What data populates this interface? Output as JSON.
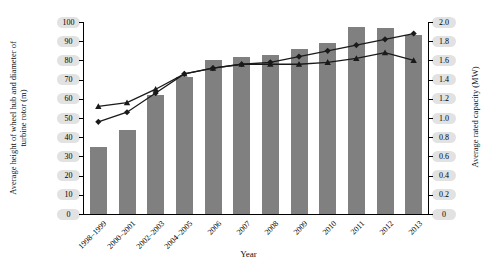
{
  "chart_data": {
    "type": "bar",
    "title": "",
    "xlabel": "Year",
    "categories": [
      "1998–1999",
      "2000–2001",
      "2002–2003",
      "2004–2005",
      "2006",
      "2007",
      "2008",
      "2009",
      "2010",
      "2011",
      "2012",
      "2013"
    ],
    "grid": false,
    "legend": "none",
    "axes": {
      "left": {
        "label": "Average height of wheel hub and diameter of turbine rotor (m)",
        "ticks": [
          "0",
          "10",
          "20",
          "30",
          "40",
          "50",
          "60",
          "70",
          "80",
          "90",
          "100"
        ],
        "lim": [
          0,
          100
        ]
      },
      "right": {
        "label": "Average rated capacity (MW)",
        "ticks": [
          "0",
          "0.2",
          "0.4",
          "0.6",
          "0.8",
          "1.0",
          "1.2",
          "1.4",
          "1.6",
          "1.8",
          "2.0"
        ],
        "lim": [
          0,
          2.0
        ]
      }
    },
    "series": [
      {
        "name": "Average rated capacity",
        "type": "bar",
        "axis": "right",
        "unit": "MW",
        "color": "#808080",
        "values": [
          0.7,
          0.88,
          1.24,
          1.43,
          1.6,
          1.64,
          1.66,
          1.72,
          1.78,
          1.95,
          1.94,
          1.86
        ]
      },
      {
        "name": "Average diameter of turbine rotor",
        "type": "line",
        "axis": "left",
        "unit": "m",
        "marker": "diamond",
        "color": "#1a1a1a",
        "values": [
          48,
          53,
          63,
          73,
          76,
          78,
          79,
          82,
          85,
          88,
          91,
          94
        ]
      },
      {
        "name": "Average height of wheel hub",
        "type": "line",
        "axis": "left",
        "unit": "m",
        "marker": "triangle",
        "color": "#1a1a1a",
        "values": [
          56,
          58,
          65,
          73,
          76,
          78,
          78,
          78,
          79,
          81,
          84,
          80
        ]
      }
    ]
  }
}
